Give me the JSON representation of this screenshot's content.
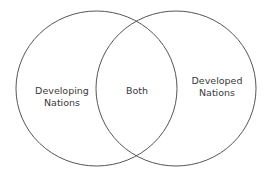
{
  "diagram": {
    "type": "venn",
    "sets": [
      {
        "label_line1": "Developing",
        "label_line2": "Nations"
      },
      {
        "label_line1": "Developed",
        "label_line2": "Nations"
      }
    ],
    "intersection": {
      "label": "Both"
    },
    "stroke_color": "#555555"
  }
}
